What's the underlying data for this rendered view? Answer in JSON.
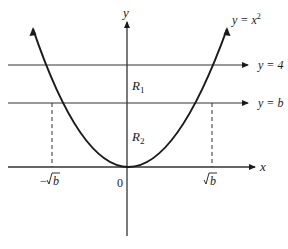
{
  "diagram": {
    "type": "region-bounded-by-parabola",
    "colors": {
      "ink": "#1a1a1a",
      "axis": "#333333",
      "background": "#ffffff"
    },
    "axes": {
      "x_label": "x",
      "y_label": "y",
      "origin_label": "0"
    },
    "curve": {
      "equation_label": "y = x",
      "exponent": "2"
    },
    "lines": [
      {
        "id": "line-y4",
        "label": "y = 4"
      },
      {
        "id": "line-yb",
        "label": "y = b"
      }
    ],
    "regions": [
      {
        "id": "R1",
        "base": "R",
        "sub": "1"
      },
      {
        "id": "R2",
        "base": "R",
        "sub": "2"
      }
    ],
    "ticks": {
      "neg_sqrt_b": {
        "sign": "−",
        "base": "b"
      },
      "pos_sqrt_b": {
        "sign": "",
        "base": "b"
      }
    }
  }
}
